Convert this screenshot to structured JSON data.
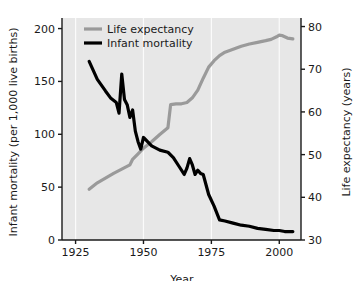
{
  "chart_data": {
    "type": "line",
    "title": "",
    "xlabel": "Year",
    "ylabel": "Infant mortality (per 1,000 live births)",
    "y2label": "Life expectancy (years)",
    "xlim": [
      1920,
      2008
    ],
    "ylim": [
      0,
      210
    ],
    "y2lim": [
      30,
      82
    ],
    "xticks": [
      1925,
      1950,
      1975,
      2000
    ],
    "xtick_labels": [
      "1925",
      "1950",
      "1975",
      "2000"
    ],
    "yticks": [
      0,
      50,
      100,
      150,
      200
    ],
    "ytick_labels": [
      "0",
      "50",
      "100",
      "150",
      "200"
    ],
    "y2ticks": [
      30,
      40,
      50,
      60,
      70,
      80
    ],
    "y2tick_labels": [
      "30",
      "40",
      "50",
      "60",
      "70",
      "80"
    ],
    "grid": true,
    "grid_axis": "x",
    "legend_position": "top-left",
    "series": [
      {
        "name": "Life expectancy",
        "axis": "right",
        "color": "#9a9a9a",
        "width": 3.2,
        "x": [
          1930,
          1933,
          1936,
          1939,
          1942,
          1945,
          1946,
          1948,
          1950,
          1953,
          1956,
          1959,
          1960,
          1962,
          1964,
          1966,
          1968,
          1970,
          1972,
          1974,
          1976,
          1978,
          1980,
          1983,
          1986,
          1989,
          1992,
          1995,
          1997,
          1999,
          2000,
          2001,
          2003,
          2005
        ],
        "values": [
          41.9,
          43.4,
          44.5,
          45.6,
          46.6,
          47.6,
          48.9,
          50.2,
          51.5,
          53.0,
          54.7,
          56.3,
          61.7,
          61.9,
          61.9,
          62.2,
          63.3,
          65.1,
          67.9,
          70.5,
          72.0,
          73.2,
          74.0,
          74.7,
          75.4,
          75.9,
          76.3,
          76.7,
          77.0,
          77.6,
          78.0,
          77.9,
          77.3,
          77.1
        ]
      },
      {
        "name": "Infant mortality",
        "axis": "left",
        "color": "#000000",
        "width": 3.2,
        "x": [
          1930,
          1933,
          1936,
          1938,
          1940,
          1941,
          1942,
          1943,
          1944,
          1945,
          1946,
          1947,
          1948,
          1949,
          1950,
          1953,
          1956,
          1959,
          1961,
          1963,
          1965,
          1966,
          1967,
          1968,
          1969,
          1970,
          1971,
          1972,
          1974,
          1976,
          1978,
          1980,
          1983,
          1986,
          1989,
          1992,
          1995,
          1998,
          2000,
          2002,
          2005
        ],
        "values": [
          169,
          152,
          141,
          134,
          130,
          120,
          157,
          133,
          128,
          116,
          123,
          103,
          93,
          86,
          97,
          89,
          85,
          83,
          78,
          70,
          62,
          68,
          77,
          71,
          62,
          66,
          63,
          62,
          43,
          32,
          19,
          18,
          16,
          14,
          13,
          11,
          10,
          9,
          9,
          8,
          8
        ]
      }
    ],
    "legend": [
      {
        "label": "Life expectancy",
        "color": "#9a9a9a"
      },
      {
        "label": "Infant mortality",
        "color": "#000000"
      }
    ],
    "style": {
      "plot_background": "#e7e7e7",
      "grid_color": "#fbfbfb",
      "axis_color": "#1a1a1a",
      "figure_background": "#ffffff"
    }
  }
}
